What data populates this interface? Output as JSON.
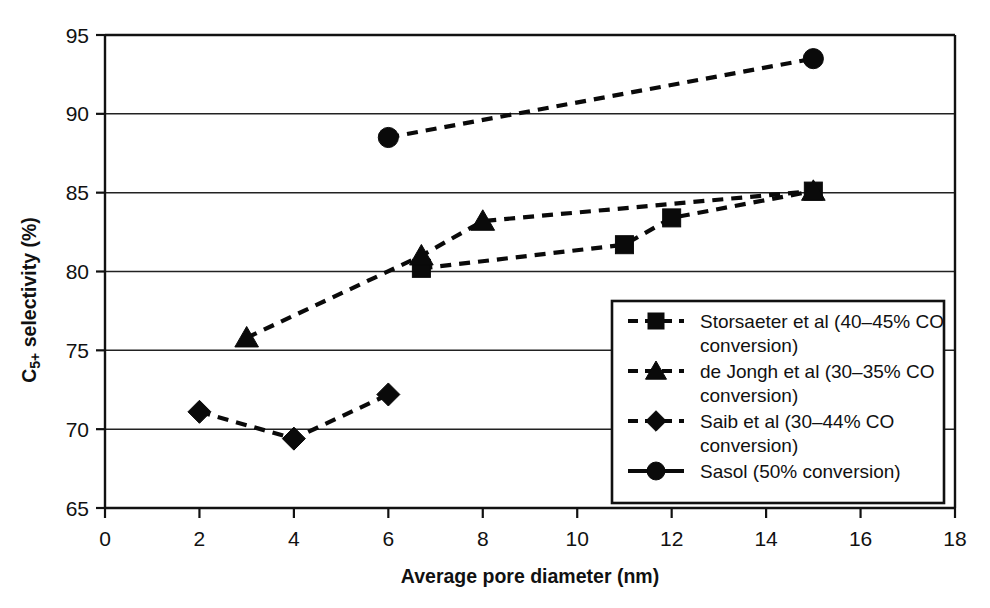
{
  "chart_data": {
    "type": "scatter",
    "title": "",
    "xlabel": "Average pore diameter (nm)",
    "ylabel": "C5+ selectivity (%)",
    "ylabel_parts": {
      "base": "C",
      "sub": "5+",
      "rest": " selectivity (%)"
    },
    "xlim": [
      0,
      18
    ],
    "ylim": [
      65,
      95
    ],
    "xticks": [
      0,
      2,
      4,
      6,
      8,
      10,
      12,
      14,
      16,
      18
    ],
    "yticks": [
      65,
      70,
      75,
      80,
      85,
      90,
      95
    ],
    "xtick_labels": [
      "0",
      "2",
      "4",
      "6",
      "8",
      "10",
      "12",
      "14",
      "16",
      "18"
    ],
    "ytick_labels": [
      "65",
      "70",
      "75",
      "80",
      "85",
      "90",
      "95"
    ],
    "grid": "horizontal",
    "legend_position": "bottom-right",
    "series": [
      {
        "name": "Storsaeter et al (40–45% CO conversion)",
        "marker": "square",
        "linestyle": "dashed",
        "x": [
          6.7,
          11,
          12,
          15
        ],
        "y": [
          80.2,
          81.7,
          83.4,
          85.1
        ]
      },
      {
        "name": "de Jongh et al (30–35% CO conversion)",
        "marker": "triangle",
        "linestyle": "dashed",
        "x": [
          3,
          6.7,
          8,
          15
        ],
        "y": [
          75.8,
          81.0,
          83.2,
          85.1
        ]
      },
      {
        "name": "Saib et al (30–44% CO conversion)",
        "marker": "diamond",
        "linestyle": "dashed",
        "x": [
          2,
          4,
          6
        ],
        "y": [
          71.1,
          69.4,
          72.2
        ]
      },
      {
        "name": "Sasol (50% conversion)",
        "marker": "circle",
        "linestyle": "dashed",
        "legend_linestyle": "solid",
        "x": [
          6,
          15
        ],
        "y": [
          88.5,
          93.5
        ]
      }
    ]
  },
  "legend": {
    "entries": [
      {
        "label_line1": "Storsaeter et al (40–45% CO",
        "label_line2": "conversion)",
        "marker": "square"
      },
      {
        "label_line1": "de Jongh et al (30–35% CO",
        "label_line2": "conversion)",
        "marker": "triangle"
      },
      {
        "label_line1": "Saib et al (30–44% CO",
        "label_line2": "conversion)",
        "marker": "diamond"
      },
      {
        "label_line1": "Sasol (50% conversion)",
        "label_line2": "",
        "marker": "circle"
      }
    ]
  },
  "colors": {
    "foreground": "#0a0a0a",
    "grid": "#222222",
    "background": "#ffffff"
  }
}
